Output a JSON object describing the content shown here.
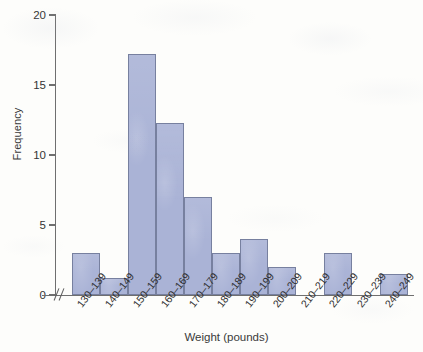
{
  "chart_data": {
    "type": "bar",
    "title": "",
    "xlabel": "Weight (pounds)",
    "ylabel": "Frequency",
    "categories": [
      "130–139",
      "140–149",
      "150–159",
      "160–169",
      "170–179",
      "180–189",
      "190–199",
      "200–209",
      "210–219",
      "220–229",
      "230–239",
      "240–249"
    ],
    "values": [
      3,
      1.2,
      17.2,
      12.3,
      7,
      3,
      4,
      2,
      0,
      3,
      0,
      1.5
    ],
    "ylim": [
      0,
      20
    ],
    "ytick_labels": [
      "0",
      "5",
      "10",
      "15",
      "20"
    ],
    "ytick_values": [
      0,
      5,
      10,
      15,
      20
    ],
    "grid": false,
    "legend": false,
    "bar_color": "#aab3d6",
    "bar_border_color": "#77809f",
    "axis_color": "#6f6f6f",
    "axis_break": "//"
  }
}
